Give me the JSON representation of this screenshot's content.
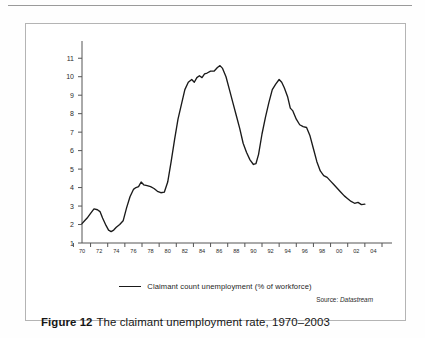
{
  "figure": {
    "caption_label": "Figure 12",
    "caption_text": "The claimant unemployment rate, 1970–2003",
    "source_prefix": "Source:",
    "source_name": "Datastream"
  },
  "legend": {
    "items": [
      {
        "label": "Claimant count unemployment (% of workforce)",
        "color": "#1a1a1a"
      }
    ]
  },
  "chart_data": {
    "type": "line",
    "title": "The claimant unemployment rate, 1970–2003",
    "xlabel": "",
    "ylabel": "",
    "ylim": [
      1,
      11.5
    ],
    "xlim": [
      1970,
      2005
    ],
    "grid": false,
    "legend_position": "bottom-center",
    "source": "Datastream",
    "yticks": [
      1,
      2,
      3,
      4,
      5,
      6,
      7,
      8,
      9,
      10,
      11
    ],
    "ytick_labels": [
      "1",
      "2",
      "3",
      "4",
      "5",
      "6",
      "7",
      "8",
      "9",
      "10",
      "11"
    ],
    "xticks": [
      1970,
      1972,
      1974,
      1976,
      1978,
      1980,
      1982,
      1984,
      1986,
      1988,
      1990,
      1992,
      1994,
      1996,
      1998,
      2000,
      2002,
      2004
    ],
    "xtick_labels": [
      "70",
      "72",
      "74",
      "76",
      "78",
      "80",
      "82",
      "84",
      "86",
      "88",
      "90",
      "92",
      "94",
      "96",
      "98",
      "00",
      "02",
      "04"
    ],
    "series": [
      {
        "name": "Claimant count unemployment (% of workforce)",
        "color": "#1a1a1a",
        "units": "% of workforce",
        "x": [
          1970.0,
          1970.3,
          1970.6,
          1971.0,
          1971.4,
          1971.8,
          1972.1,
          1972.4,
          1972.8,
          1973.1,
          1973.4,
          1973.7,
          1974.0,
          1974.4,
          1974.8,
          1975.2,
          1975.6,
          1976.0,
          1976.3,
          1976.6,
          1976.9,
          1977.2,
          1977.6,
          1978.0,
          1978.4,
          1978.8,
          1979.2,
          1979.6,
          1980.0,
          1980.4,
          1980.8,
          1981.2,
          1981.6,
          1982.0,
          1982.4,
          1982.8,
          1983.1,
          1983.4,
          1983.7,
          1984.0,
          1984.3,
          1984.6,
          1985.0,
          1985.4,
          1985.8,
          1986.1,
          1986.4,
          1986.8,
          1987.2,
          1987.6,
          1988.0,
          1988.4,
          1988.8,
          1989.2,
          1989.6,
          1990.0,
          1990.3,
          1990.6,
          1991.0,
          1991.4,
          1991.8,
          1992.2,
          1992.6,
          1993.0,
          1993.3,
          1993.6,
          1994.0,
          1994.3,
          1994.6,
          1995.0,
          1995.4,
          1995.8,
          1996.2,
          1996.6,
          1997.0,
          1997.4,
          1997.8,
          1998.2,
          1998.6,
          1999.0,
          1999.4,
          1999.8,
          2000.2,
          2000.6,
          2001.0,
          2001.4,
          2001.8,
          2002.2,
          2002.6,
          2003.0
        ],
        "y": [
          2.05,
          2.2,
          2.35,
          2.6,
          2.85,
          2.8,
          2.7,
          2.35,
          1.95,
          1.7,
          1.62,
          1.7,
          1.85,
          2.0,
          2.2,
          2.9,
          3.5,
          3.9,
          4.0,
          4.05,
          4.3,
          4.15,
          4.1,
          4.05,
          3.95,
          3.8,
          3.72,
          3.75,
          4.3,
          5.4,
          6.6,
          7.7,
          8.5,
          9.3,
          9.7,
          9.85,
          9.7,
          9.95,
          10.05,
          9.95,
          10.15,
          10.2,
          10.3,
          10.3,
          10.5,
          10.6,
          10.45,
          10.0,
          9.3,
          8.6,
          7.9,
          7.2,
          6.4,
          5.9,
          5.5,
          5.25,
          5.3,
          5.8,
          6.9,
          7.8,
          8.6,
          9.3,
          9.6,
          9.85,
          9.7,
          9.4,
          8.9,
          8.3,
          8.15,
          7.7,
          7.4,
          7.3,
          7.25,
          6.8,
          6.1,
          5.4,
          4.9,
          4.65,
          4.55,
          4.35,
          4.15,
          3.95,
          3.75,
          3.55,
          3.4,
          3.25,
          3.15,
          3.2,
          3.08,
          3.1
        ]
      }
    ]
  }
}
